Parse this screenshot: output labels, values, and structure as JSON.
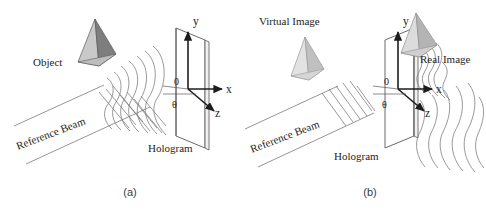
{
  "figure": {
    "type": "diagram",
    "background_color": "#ffffff",
    "ink_color": "#1d1d1d",
    "line_color": "#6b6b6b"
  },
  "panels": [
    {
      "id": "a",
      "caption": "(a)",
      "title": "recording",
      "labels": {
        "object": "Object",
        "reference_beam": "Reference Beam",
        "hologram": "Hologram"
      },
      "axes": {
        "x": "x",
        "y": "y",
        "z": "z",
        "origin": "0",
        "angle": "θ"
      },
      "objects": [
        {
          "name": "object-pyramid",
          "shading": {
            "left_face": "#c9c9c9",
            "right_face": "#7e7e7e",
            "outline": "#555555"
          }
        }
      ],
      "wavefronts": {
        "object_wave": {
          "style": "wavy",
          "count": 7
        },
        "reference_wave": {
          "style": "straight-parallel",
          "count": 7
        }
      }
    },
    {
      "id": "b",
      "caption": "(b)",
      "title": "reconstruction",
      "labels": {
        "virtual_image": "Virtual Image",
        "real_image": "Real Image",
        "reference_beam": "Reference Beam",
        "hologram": "Hologram"
      },
      "axes": {
        "x": "x",
        "y": "y",
        "z": "z",
        "origin": "0",
        "angle": "θ"
      },
      "objects": [
        {
          "name": "virtual-image-pyramid",
          "shading": {
            "left_face": "#e2e2e2",
            "right_face": "#c0c0c0",
            "outline": "#9a9a9a"
          }
        },
        {
          "name": "real-image-pyramid",
          "shading": {
            "left_face": "#dcdcdc",
            "right_face": "#b4b4b4",
            "outline": "#8f8f8f"
          }
        }
      ],
      "wavefronts": {
        "reference_wave": {
          "style": "straight-parallel",
          "count": 6
        },
        "diffracted_wave_near": {
          "style": "wavy",
          "count": 5
        },
        "real_image_wave": {
          "style": "wavy",
          "count": 6
        }
      }
    }
  ]
}
